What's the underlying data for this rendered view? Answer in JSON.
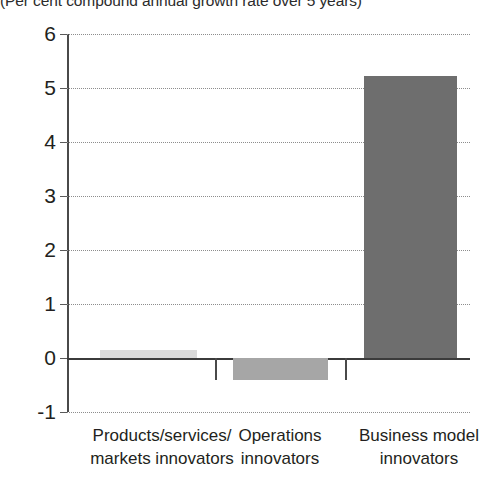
{
  "subtitle": "(Per cent compound annual growth rate over 5 years)",
  "chart_data": {
    "type": "bar",
    "title": "",
    "subtitle": "(Per cent compound annual growth rate over 5 years)",
    "xlabel": "",
    "ylabel": "",
    "categories": [
      "Products/services/ markets innovators",
      "Operations innovators",
      "Business model innovators"
    ],
    "category_lines": [
      [
        "Products/services/",
        "markets innovators"
      ],
      [
        "Operations",
        "innovators"
      ],
      [
        "Business model",
        "innovators"
      ]
    ],
    "values": [
      0.15,
      -0.4,
      5.22
    ],
    "bar_colors": [
      "#d9d9d9",
      "#a6a6a6",
      "#6e6e6e"
    ],
    "ylim": [
      -1,
      6
    ],
    "yticks": [
      6,
      5,
      4,
      3,
      2,
      1,
      0,
      -1
    ],
    "ytick_labels": [
      "6",
      "5",
      "4",
      "3",
      "2",
      "1",
      "0",
      "-1"
    ],
    "grid": true,
    "grid_style": "dotted",
    "legend": "none",
    "zero_line": 0
  }
}
